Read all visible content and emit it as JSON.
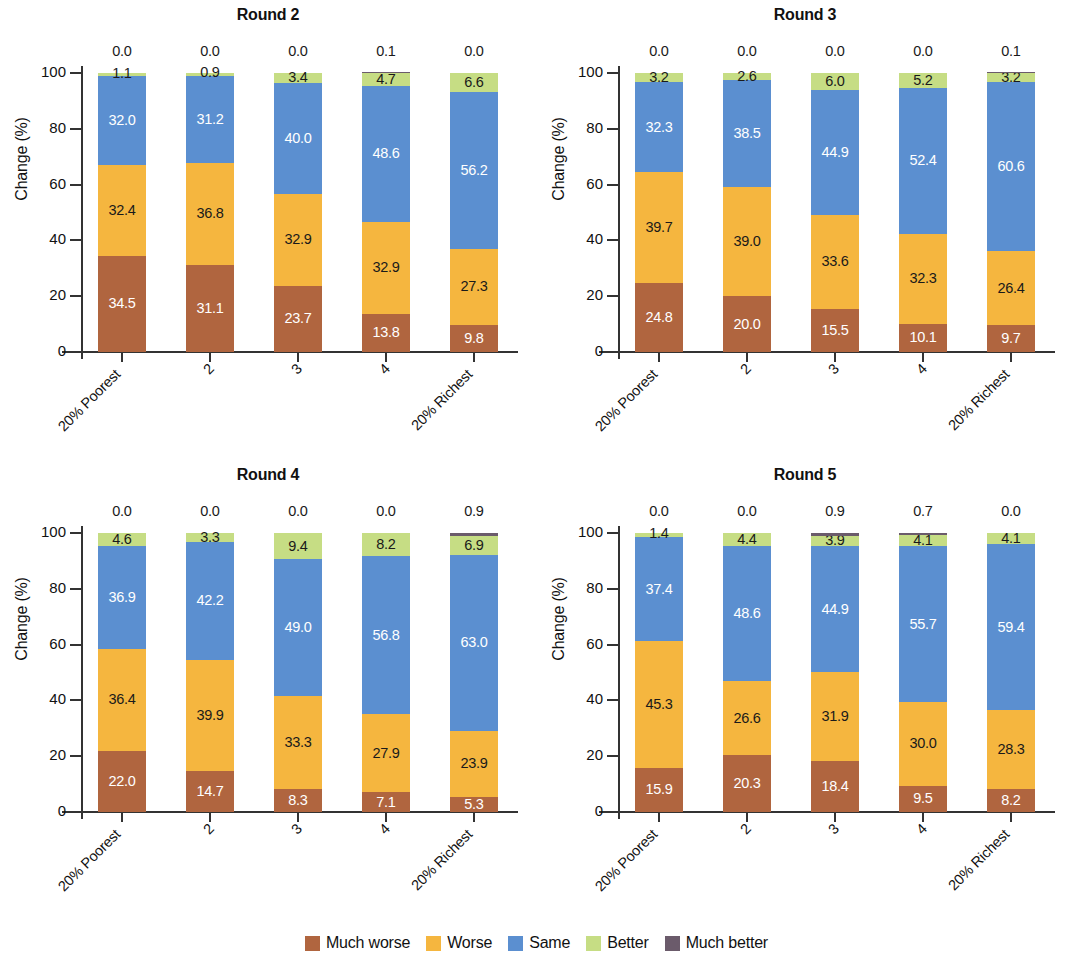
{
  "figure": {
    "ylabel": "Change (%)",
    "yticks": [
      0,
      20,
      40,
      60,
      80,
      100
    ],
    "categories": [
      "20% Poorest",
      "2",
      "3",
      "4",
      "20% Richest"
    ]
  },
  "legend": {
    "position": "bottom-center",
    "items": [
      {
        "label": "Much worse",
        "color": "#B0653F"
      },
      {
        "label": "Worse",
        "color": "#F5B63F"
      },
      {
        "label": "Same",
        "color": "#5B8FD0"
      },
      {
        "label": "Better",
        "color": "#C6DD84"
      },
      {
        "label": "Much better",
        "color": "#6B5B6B"
      }
    ]
  },
  "chart_data": [
    {
      "type": "bar",
      "title": "Round 2",
      "xlabel": "",
      "ylabel": "Change (%)",
      "ylim": [
        0,
        100
      ],
      "yticks": [
        0,
        20,
        40,
        60,
        80,
        100
      ],
      "grid": false,
      "stacked": true,
      "categories": [
        "20% Poorest",
        "2",
        "3",
        "4",
        "20% Richest"
      ],
      "series": [
        {
          "name": "Much worse",
          "color": "#B0653F",
          "values": [
            34.5,
            31.1,
            23.7,
            13.8,
            9.8
          ]
        },
        {
          "name": "Worse",
          "color": "#F5B63F",
          "values": [
            32.4,
            36.8,
            32.9,
            32.9,
            27.3
          ]
        },
        {
          "name": "Same",
          "color": "#5B8FD0",
          "values": [
            32.0,
            31.2,
            40.0,
            48.6,
            56.2
          ]
        },
        {
          "name": "Better",
          "color": "#C6DD84",
          "values": [
            1.1,
            0.9,
            3.4,
            4.7,
            6.6
          ]
        },
        {
          "name": "Much better",
          "color": "#6B5B6B",
          "values": [
            0.0,
            0.0,
            0.0,
            0.1,
            0.0
          ]
        }
      ]
    },
    {
      "type": "bar",
      "title": "Round 3",
      "xlabel": "",
      "ylabel": "Change (%)",
      "ylim": [
        0,
        100
      ],
      "yticks": [
        0,
        20,
        40,
        60,
        80,
        100
      ],
      "grid": false,
      "stacked": true,
      "categories": [
        "20% Poorest",
        "2",
        "3",
        "4",
        "20% Richest"
      ],
      "series": [
        {
          "name": "Much worse",
          "color": "#B0653F",
          "values": [
            24.8,
            20.0,
            15.5,
            10.1,
            9.7
          ]
        },
        {
          "name": "Worse",
          "color": "#F5B63F",
          "values": [
            39.7,
            39.0,
            33.6,
            32.3,
            26.4
          ]
        },
        {
          "name": "Same",
          "color": "#5B8FD0",
          "values": [
            32.3,
            38.5,
            44.9,
            52.4,
            60.6
          ]
        },
        {
          "name": "Better",
          "color": "#C6DD84",
          "values": [
            3.2,
            2.6,
            6.0,
            5.2,
            3.2
          ]
        },
        {
          "name": "Much better",
          "color": "#6B5B6B",
          "values": [
            0.0,
            0.0,
            0.0,
            0.0,
            0.1
          ]
        }
      ]
    },
    {
      "type": "bar",
      "title": "Round 4",
      "xlabel": "",
      "ylabel": "Change (%)",
      "ylim": [
        0,
        100
      ],
      "yticks": [
        0,
        20,
        40,
        60,
        80,
        100
      ],
      "grid": false,
      "stacked": true,
      "categories": [
        "20% Poorest",
        "2",
        "3",
        "4",
        "20% Richest"
      ],
      "series": [
        {
          "name": "Much worse",
          "color": "#B0653F",
          "values": [
            22.0,
            14.7,
            8.3,
            7.1,
            5.3
          ]
        },
        {
          "name": "Worse",
          "color": "#F5B63F",
          "values": [
            36.4,
            39.9,
            33.3,
            27.9,
            23.9
          ]
        },
        {
          "name": "Same",
          "color": "#5B8FD0",
          "values": [
            36.9,
            42.2,
            49.0,
            56.8,
            63.0
          ]
        },
        {
          "name": "Better",
          "color": "#C6DD84",
          "values": [
            4.6,
            3.3,
            9.4,
            8.2,
            6.9
          ]
        },
        {
          "name": "Much better",
          "color": "#6B5B6B",
          "values": [
            0.0,
            0.0,
            0.0,
            0.0,
            0.9
          ]
        }
      ]
    },
    {
      "type": "bar",
      "title": "Round 5",
      "xlabel": "",
      "ylabel": "Change (%)",
      "ylim": [
        0,
        100
      ],
      "yticks": [
        0,
        20,
        40,
        60,
        80,
        100
      ],
      "grid": false,
      "stacked": true,
      "categories": [
        "20% Poorest",
        "2",
        "3",
        "4",
        "20% Richest"
      ],
      "series": [
        {
          "name": "Much worse",
          "color": "#B0653F",
          "values": [
            15.9,
            20.3,
            18.4,
            9.5,
            8.2
          ]
        },
        {
          "name": "Worse",
          "color": "#F5B63F",
          "values": [
            45.3,
            26.6,
            31.9,
            30.0,
            28.3
          ]
        },
        {
          "name": "Same",
          "color": "#5B8FD0",
          "values": [
            37.4,
            48.6,
            44.9,
            55.7,
            59.4
          ]
        },
        {
          "name": "Better",
          "color": "#C6DD84",
          "values": [
            1.4,
            4.4,
            3.9,
            4.1,
            4.1
          ]
        },
        {
          "name": "Much better",
          "color": "#6B5B6B",
          "values": [
            0.0,
            0.0,
            0.9,
            0.7,
            0.0
          ]
        }
      ]
    }
  ]
}
